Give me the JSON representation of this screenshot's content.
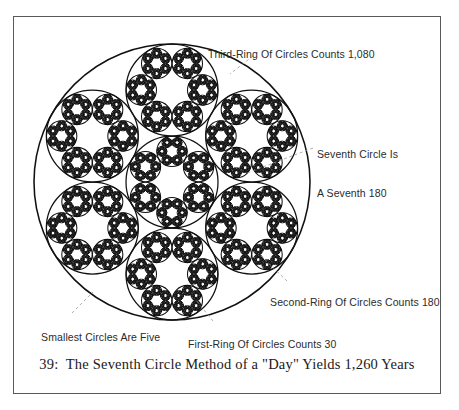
{
  "figure": {
    "caption": "39:  The Seventh Circle Method of a \"Day\" Yields 1,260 Years",
    "frame_color": "#5a5a5a",
    "ink_color": "#111111",
    "leader_color": "#8f8f8f",
    "background": "#ffffff"
  },
  "annotations": {
    "third_ring": "Third-Ring Of Circles Counts 1,080",
    "seventh_circle_line1": "Seventh Circle Is",
    "seventh_circle_line2": "A Seventh 180",
    "second_ring": "Second-Ring Of Circles Counts 180",
    "smallest": "Smallest Circles Are Five",
    "first_ring": "First-Ring Of Circles Counts 30"
  },
  "chart_data": {
    "type": "diagram",
    "title": "The Seventh Circle Method of a \"Day\" Yields 1,260 Years",
    "figure_number": "39",
    "geometry": {
      "outer_circle": {
        "cx": 172,
        "cy": 182,
        "r": 138
      },
      "unit_count": 7,
      "unit_layout": "hexagonal: 1 center + 6 ring",
      "ring_counts": [
        6,
        6,
        5
      ],
      "levels": [
        {
          "name": "Seventh Circle",
          "count": 7,
          "value": 180,
          "label": "A Seventh 180"
        },
        {
          "name": "First-Ring Of Circles",
          "count": 6,
          "value": 30,
          "label": "First-Ring Of Circles Counts 30"
        },
        {
          "name": "Second-Ring Of Circles",
          "count": 36,
          "value": 180,
          "label": "Second-Ring Of Circles Counts 180"
        },
        {
          "name": "Third-Ring Of Circles",
          "count": 216,
          "value": 1080,
          "label": "Third-Ring Of Circles Counts 1,080"
        },
        {
          "name": "Smallest Circles",
          "count": 5,
          "value": 5,
          "label": "Smallest Circles Are Five"
        }
      ],
      "total_years": 1260
    }
  }
}
